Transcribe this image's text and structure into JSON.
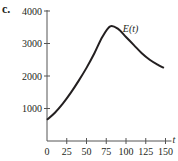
{
  "panel_label": "c.",
  "chart_data": {
    "type": "line",
    "title": "",
    "xlabel": "t",
    "ylabel": "",
    "xlim": [
      0,
      150
    ],
    "ylim": [
      0,
      4000
    ],
    "x_ticks": [
      0,
      25,
      50,
      75,
      100,
      125,
      150
    ],
    "y_ticks": [
      1000,
      2000,
      3000,
      4000
    ],
    "grid": false,
    "legend": null,
    "annotations": [
      {
        "text": "E(t)",
        "x": 96,
        "y": 3350
      }
    ],
    "series": [
      {
        "name": "E(t)",
        "x": [
          0,
          10,
          20,
          30,
          40,
          50,
          60,
          70,
          80,
          90,
          100,
          110,
          120,
          130,
          140,
          148
        ],
        "y": [
          650,
          870,
          1150,
          1480,
          1850,
          2250,
          2700,
          3200,
          3530,
          3450,
          3200,
          2950,
          2700,
          2500,
          2350,
          2250
        ]
      }
    ]
  }
}
